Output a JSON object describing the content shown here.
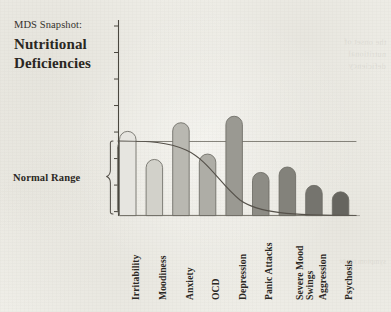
{
  "title": {
    "kicker": "MDS Snapshot:",
    "headline_line1": "Nutritional",
    "headline_line2": "Deficiencies"
  },
  "annotations": {
    "normal_range_label": "Normal Range"
  },
  "bleed_through": {
    "text_top": "the onset of\nnutritional\ndeficiency",
    "text_bottom": "symptom range"
  },
  "colors": {
    "paper": "#f1f0ea",
    "ink": "#2b2823",
    "axis": "#4a473f",
    "curve": "#55514a",
    "brace": "#55514a"
  },
  "chart_data": {
    "type": "bar",
    "title": "Nutritional Deficiencies",
    "xlabel": "",
    "ylabel": "",
    "grid": false,
    "legend": false,
    "ylim": [
      0,
      100
    ],
    "y_tick_count": 8,
    "y_tick_labels": [],
    "categories": [
      "Irritability",
      "Moodiness",
      "Anxiety",
      "OCD",
      "Depression",
      "Panic Attacks",
      "Severe Mood Swings",
      "Aggression",
      "Psychosis"
    ],
    "values": [
      78,
      52,
      86,
      57,
      92,
      40,
      45,
      28,
      22
    ],
    "bar_colors": [
      "#e6e5e0",
      "#d2d1ca",
      "#b9b8b1",
      "#aeada6",
      "#9a9992",
      "#8d8c85",
      "#83827b",
      "#75746e",
      "#66655f"
    ],
    "bar_edge_color": "#6d6b64",
    "bar_shape": "rounded-top",
    "overlay_curve": {
      "name": "threshold-sigmoid",
      "type": "line",
      "description": "Descending sigmoid from normal range plateau to baseline",
      "color": "#55514a"
    },
    "normal_range_band": {
      "label": "Normal Range",
      "top_value": 78,
      "bottom_value": 0
    }
  }
}
